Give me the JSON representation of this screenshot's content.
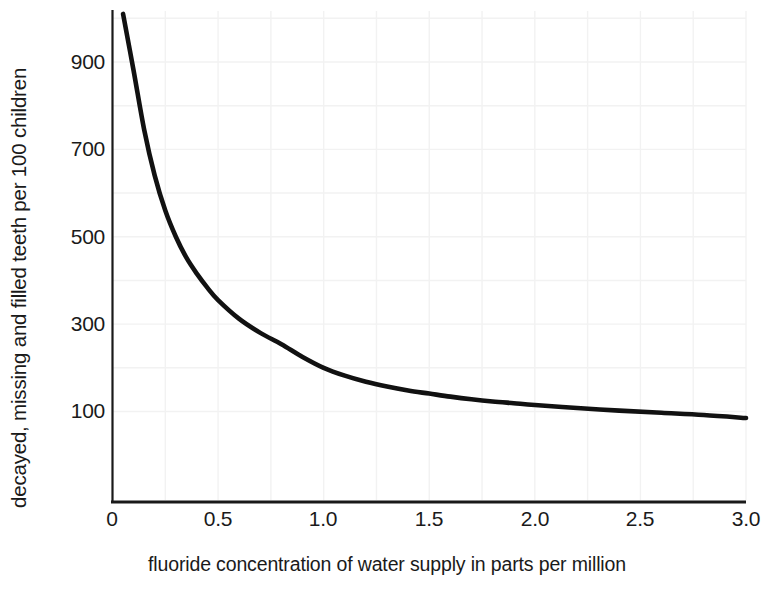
{
  "chart_data": {
    "type": "line",
    "title": "",
    "subtitle": "",
    "xlabel": "fluoride concentration of water supply in parts per million",
    "ylabel": "decayed, missing and filled teeth per 100 children",
    "xlim": [
      0,
      3.0
    ],
    "ylim": [
      0,
      1000
    ],
    "xticks": [
      "0",
      "0.5",
      "1.0",
      "1.5",
      "2.0",
      "2.5",
      "3.0"
    ],
    "xtick_values": [
      0,
      0.5,
      1.0,
      1.5,
      2.0,
      2.5,
      3.0
    ],
    "yticks": [
      "100",
      "300",
      "500",
      "700",
      "900"
    ],
    "ytick_values": [
      100,
      300,
      500,
      700,
      900
    ],
    "grid": "faint",
    "legend": "none",
    "line_color": "#111111",
    "axis_color": "#1a1a1a",
    "grid_color": "#f2f2f2",
    "series": [
      {
        "name": "decayed, missing and filled teeth",
        "x": [
          0.05,
          0.1,
          0.15,
          0.2,
          0.25,
          0.3,
          0.35,
          0.4,
          0.45,
          0.5,
          0.6,
          0.7,
          0.8,
          0.9,
          1.0,
          1.1,
          1.2,
          1.3,
          1.4,
          1.5,
          1.6,
          1.7,
          1.8,
          1.9,
          2.0,
          2.2,
          2.4,
          2.6,
          2.8,
          3.0
        ],
        "y": [
          1010,
          880,
          745,
          640,
          560,
          500,
          452,
          415,
          383,
          355,
          312,
          280,
          254,
          225,
          200,
          182,
          168,
          157,
          148,
          141,
          134,
          128,
          123,
          119,
          115,
          108,
          102,
          97,
          92,
          85
        ]
      }
    ]
  }
}
